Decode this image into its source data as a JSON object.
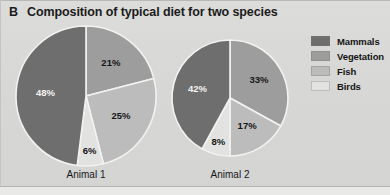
{
  "panel": {
    "letter": "B",
    "title": "Composition of typical diet for two species",
    "background_color": "#d9d9d7"
  },
  "legend": {
    "position": "right",
    "items": [
      {
        "label": "Mammals",
        "color": "#6e6e6e"
      },
      {
        "label": "Vegetation",
        "color": "#9d9d9d"
      },
      {
        "label": "Fish",
        "color": "#bcbcbc"
      },
      {
        "label": "Birds",
        "color": "#e2e2e0"
      }
    ]
  },
  "chart_data": {
    "type": "pie",
    "title": "Composition of typical diet for two species",
    "xlabel": "",
    "ylabel": "",
    "categories": [
      "Mammals",
      "Vegetation",
      "Fish",
      "Birds"
    ],
    "colors": [
      "#6e6e6e",
      "#9d9d9d",
      "#bcbcbc",
      "#e2e2e0"
    ],
    "units": "percent",
    "start_angle_deg": 0,
    "direction": "clockwise",
    "charts": [
      {
        "name": "Animal 1",
        "label": "Animal 1",
        "center": [
          86,
          96
        ],
        "radius": 70,
        "slices": [
          {
            "category": "Vegetation",
            "value": 21,
            "label": "21%",
            "color": "#9d9d9d",
            "label_on_dark": false
          },
          {
            "category": "Fish",
            "value": 25,
            "label": "25%",
            "color": "#bcbcbc",
            "label_on_dark": false
          },
          {
            "category": "Birds",
            "value": 6,
            "label": "6%",
            "color": "#e2e2e0",
            "label_on_dark": false
          },
          {
            "category": "Mammals",
            "value": 48,
            "label": "48%",
            "color": "#6e6e6e",
            "label_on_dark": true
          }
        ]
      },
      {
        "name": "Animal 2",
        "label": "Animal 2",
        "center": [
          230,
          98
        ],
        "radius": 58,
        "slices": [
          {
            "category": "Vegetation",
            "value": 33,
            "label": "33%",
            "color": "#9d9d9d",
            "label_on_dark": false
          },
          {
            "category": "Fish",
            "value": 17,
            "label": "17%",
            "color": "#bcbcbc",
            "label_on_dark": false
          },
          {
            "category": "Birds",
            "value": 8,
            "label": "8%",
            "color": "#e2e2e0",
            "label_on_dark": false
          },
          {
            "category": "Mammals",
            "value": 42,
            "label": "42%",
            "color": "#6e6e6e",
            "label_on_dark": true
          }
        ]
      }
    ]
  },
  "axis_labels": [
    {
      "text": "Animal 1",
      "left": 46,
      "top": 169,
      "width": 80
    },
    {
      "text": "Animal 2",
      "left": 190,
      "top": 169,
      "width": 80
    }
  ]
}
